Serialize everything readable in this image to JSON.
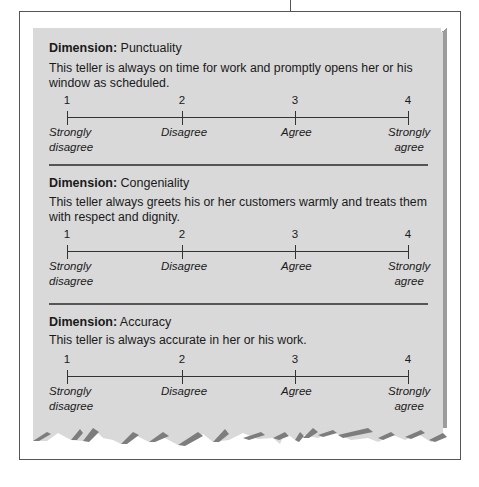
{
  "sections": [
    {
      "label": "Dimension:",
      "name": "Punctuality",
      "description": "This teller is always on time for work and promptly opens her or his window as scheduled."
    },
    {
      "label": "Dimension:",
      "name": "Congeniality",
      "description": "This teller always greets his or her customers warmly and treats them with respect and dignity."
    },
    {
      "label": "Dimension:",
      "name": "Accuracy",
      "description": "This teller is always accurate in her or his work."
    }
  ],
  "scale": {
    "points": [
      {
        "value": "1",
        "label_line1": "Strongly",
        "label_line2": "disagree"
      },
      {
        "value": "2",
        "label_line1": "Disagree",
        "label_line2": ""
      },
      {
        "value": "3",
        "label_line1": "Agree",
        "label_line2": ""
      },
      {
        "value": "4",
        "label_line1": "Strongly",
        "label_line2": "agree"
      }
    ]
  },
  "colors": {
    "card_background": "#d9d9d9",
    "card_shadow": "#9c9c9c",
    "frame_border": "#555555",
    "text": "#1a1a1a"
  }
}
